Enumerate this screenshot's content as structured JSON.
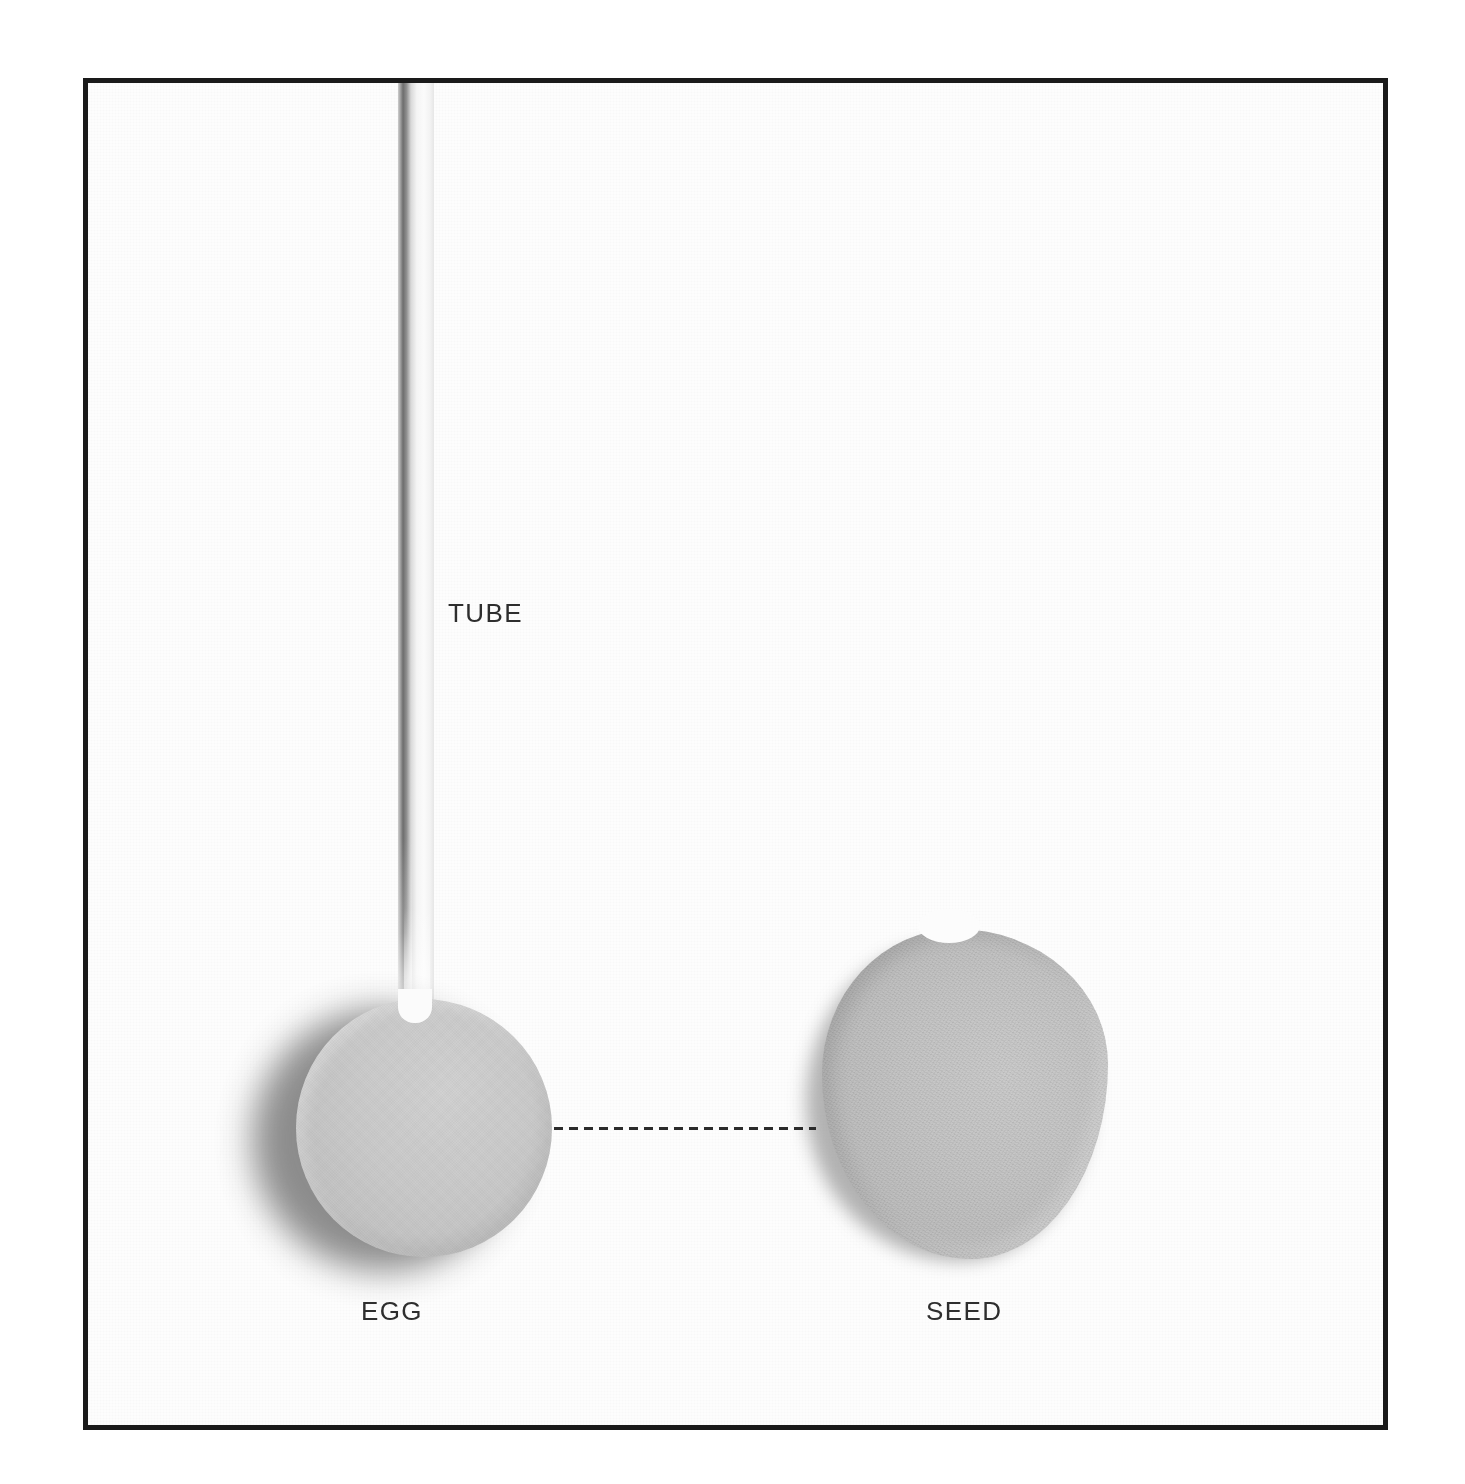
{
  "figure": {
    "type": "labeled-photographic-diagram",
    "frame": {
      "border_color": "#1a1a1a",
      "background_color": "#fdfdfd",
      "outer_background_color": "#ffffff"
    },
    "labels": [
      {
        "id": "tube",
        "text": "TUBE"
      },
      {
        "id": "egg",
        "text": "EGG"
      },
      {
        "id": "seed",
        "text": "SEED"
      }
    ],
    "objects": [
      {
        "id": "tube",
        "name": "tube",
        "label": "TUBE",
        "description": "white cylindrical tube descending vertically from the top of the frame into the egg",
        "fill_color": "#f6f6f6",
        "edge_shadow_color": "#6d6d6d"
      },
      {
        "id": "egg",
        "name": "egg",
        "label": "EGG",
        "description": "light gray circular egg with a soft cast shadow on its lower-left",
        "fill_color": "#c9c9c9",
        "shadow_color": "#838383"
      },
      {
        "id": "seed",
        "name": "seed",
        "label": "SEED",
        "description": "irregular gray rounded seed with a slight dip along its top edge",
        "fill_color": "#c4c4c4",
        "shadow_color": "#959595"
      }
    ],
    "connector": {
      "id": "egg-seed-connector",
      "style": "dashed",
      "color": "#2b2b2b",
      "from": "egg",
      "to": "seed"
    }
  }
}
